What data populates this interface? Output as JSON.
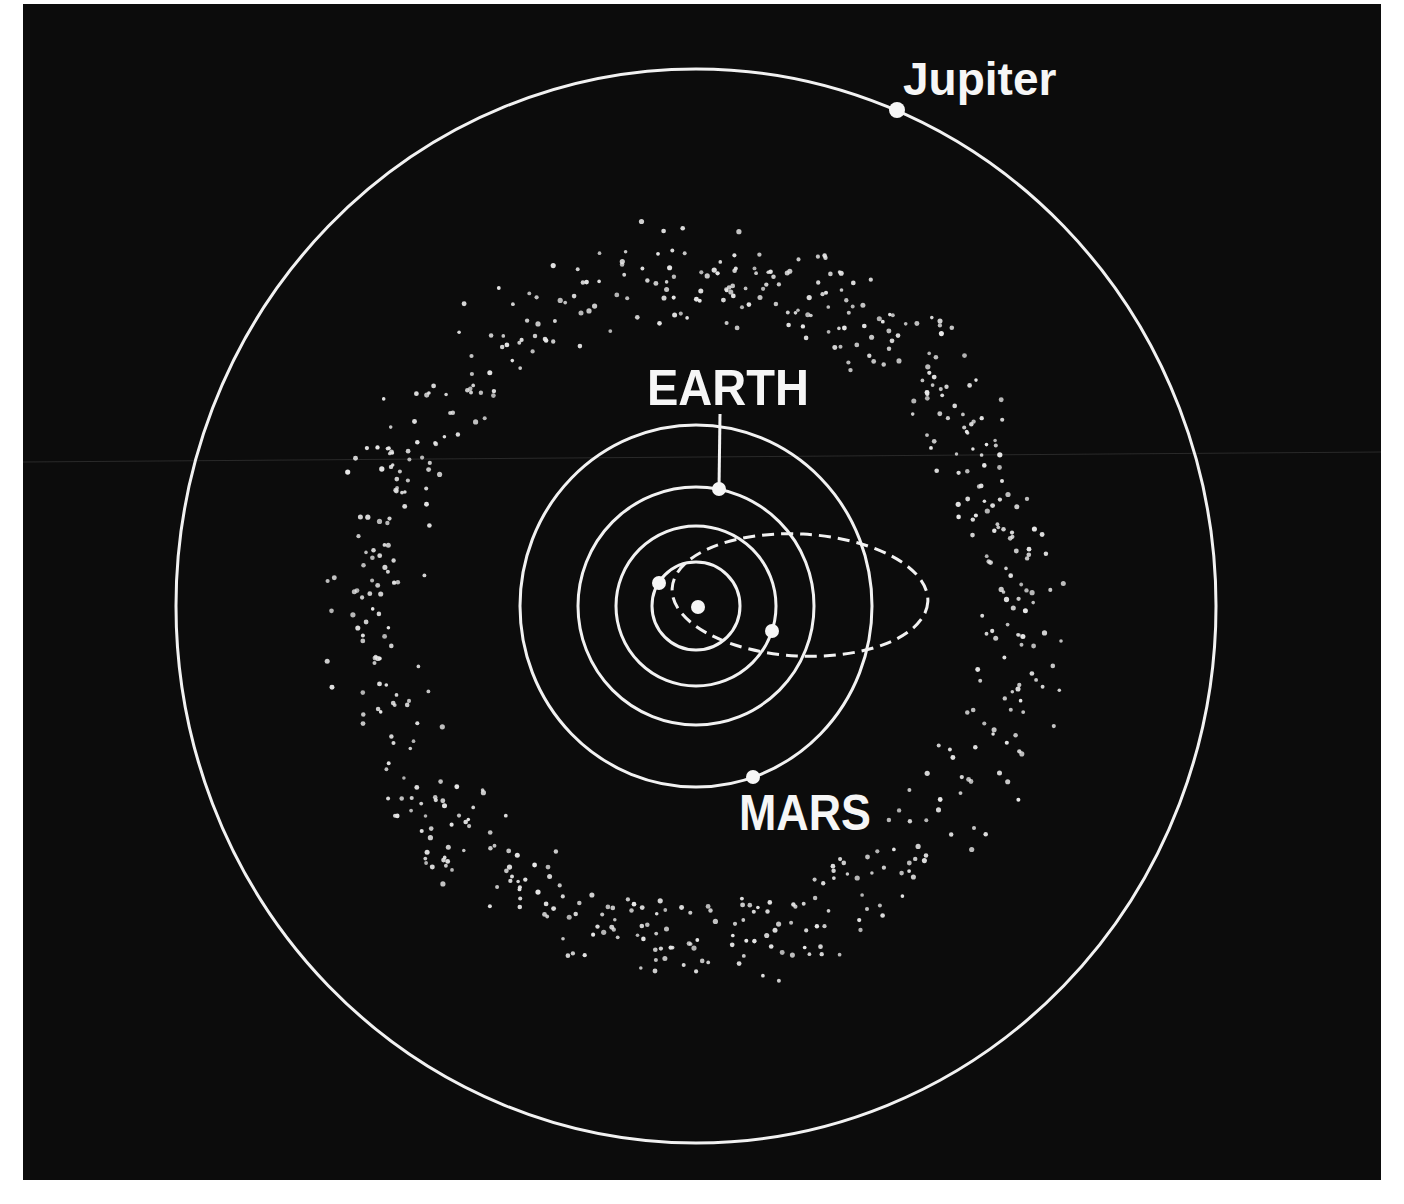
{
  "diagram": {
    "background_color": "#0c0c0c",
    "line_color": "#f2f2f2",
    "center": {
      "x": 696,
      "y": 606
    },
    "sun": {
      "x": 698,
      "y": 607,
      "r": 7
    },
    "orbits": [
      {
        "name": "mercury",
        "rx": 44,
        "ry": 44,
        "style": "solid"
      },
      {
        "name": "venus",
        "rx": 80,
        "ry": 80,
        "style": "solid"
      },
      {
        "name": "earth",
        "rx": 118,
        "ry": 119,
        "style": "solid"
      },
      {
        "name": "mars",
        "rx": 176,
        "ry": 181,
        "style": "solid"
      },
      {
        "name": "jupiter",
        "rx": 520,
        "ry": 537,
        "style": "solid"
      }
    ],
    "comet_orbit": {
      "style": "dashed",
      "cx": 800,
      "cy": 595,
      "rx": 128,
      "ry": 61,
      "rotate": 3
    },
    "planets": [
      {
        "name": "mercury",
        "x": 659,
        "y": 583,
        "r": 7
      },
      {
        "name": "venus",
        "x": 772,
        "y": 631,
        "r": 7
      },
      {
        "name": "earth",
        "x": 719,
        "y": 489,
        "r": 7
      },
      {
        "name": "mars",
        "x": 753,
        "y": 777,
        "r": 7
      },
      {
        "name": "jupiter",
        "x": 897,
        "y": 110,
        "r": 8
      }
    ],
    "labels": {
      "jupiter": {
        "text": "Jupiter",
        "x": 903,
        "y": 95,
        "size": 46
      },
      "earth": {
        "text": "EARTH",
        "x": 647,
        "y": 405,
        "size": 50
      },
      "mars": {
        "text": "MARS",
        "x": 739,
        "y": 830,
        "size": 50
      }
    },
    "earth_leader": {
      "x1": 720,
      "y1": 414,
      "x2": 719,
      "y2": 489
    },
    "asteroid_belt": {
      "inner_radius": 272,
      "outer_radius": 390,
      "count": 620,
      "dot_radius": 2.2,
      "seed": 1977
    }
  }
}
